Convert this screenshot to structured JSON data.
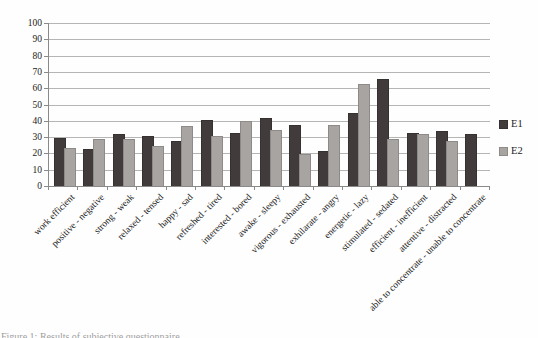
{
  "figure": {
    "caption": "Figure 1: Results of subjective questionnaire"
  },
  "legend": {
    "position": "right"
  },
  "chart_data": {
    "type": "bar",
    "title": "",
    "xlabel": "",
    "ylabel": "",
    "ylim": [
      0,
      100
    ],
    "ytick_step": 10,
    "yticks": [
      0,
      10,
      20,
      30,
      40,
      50,
      60,
      70,
      80,
      90,
      100
    ],
    "grid": true,
    "legend_position": "right",
    "categories": [
      "work efficient",
      "positive - negative",
      "strong - weak",
      "relaxed - tensed",
      "happy - sad",
      "refreshed - tired",
      "interested - bored",
      "awake - sleepy",
      "vigorous - exhausted",
      "exhilarate - angry",
      "energetic - lazy",
      "stimulated - sedated",
      "efficient - inefficient",
      "attentive - distracted",
      "able to concentrate - unable to concentrate"
    ],
    "series": [
      {
        "name": "E1",
        "color": "#413c3b",
        "values": [
          29,
          22,
          31,
          30,
          27,
          40,
          32,
          41,
          37,
          21,
          44,
          65,
          32,
          33,
          31
        ]
      },
      {
        "name": "E2",
        "color": "#a7a4a2",
        "values": [
          23,
          28,
          28,
          24,
          36,
          30,
          39,
          34,
          19,
          37,
          62,
          28,
          31,
          27,
          0
        ]
      }
    ]
  }
}
